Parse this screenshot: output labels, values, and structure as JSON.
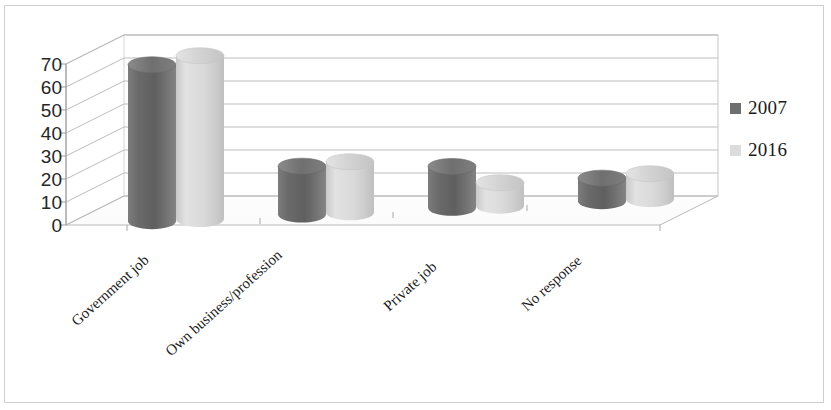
{
  "chart_data": {
    "type": "bar",
    "title": "",
    "subtitle": "",
    "xlabel": "",
    "ylabel": "",
    "ylim": [
      0,
      70
    ],
    "yticks": [
      70,
      60,
      50,
      40,
      30,
      20,
      10,
      0
    ],
    "grid": true,
    "style": "3d-cylinder-clustered-column",
    "legend_position": "right",
    "categories": [
      "Government job",
      "Own  business/profession",
      "Private job",
      "No response"
    ],
    "series": [
      {
        "name": "2007",
        "color": "#6e6e6e",
        "values": [
          68,
          21,
          18,
          10
        ]
      },
      {
        "name": "2016",
        "color": "#d9d9d9",
        "values": [
          71,
          22,
          10,
          11
        ]
      }
    ]
  },
  "legend": {
    "items": [
      {
        "label": "2007",
        "color": "#6e6e6e"
      },
      {
        "label": "2016",
        "color": "#dcdcdc"
      }
    ]
  },
  "axes": {
    "y_tick_labels": [
      "70",
      "60",
      "50",
      "40",
      "30",
      "20",
      "10",
      "0"
    ],
    "x_tick_labels": [
      "Government job",
      "Own  business/profession",
      "Private job",
      "No response"
    ]
  }
}
